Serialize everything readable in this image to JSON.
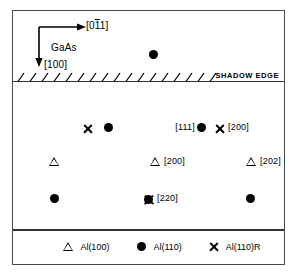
{
  "figure": {
    "orientation": {
      "material_label": "GaAs",
      "horizontal_axis_label_pre": "[0",
      "horizontal_axis_label_bar": "1",
      "horizontal_axis_label_post": "1]",
      "horizontal_axis_label_full": "[011]",
      "vertical_axis_label": "[100]"
    },
    "shadow_edge_label": "SHADOW EDGE",
    "legend": [
      {
        "marker": "triangle-open",
        "label": "Al(100)"
      },
      {
        "marker": "dot-filled",
        "label": "Al(110)"
      },
      {
        "marker": "cross",
        "label": "Al(110)R"
      }
    ],
    "markers": [
      {
        "id": "m0",
        "marker": "dot-filled",
        "x": 136,
        "y": 38,
        "label": ""
      },
      {
        "id": "m1",
        "marker": "cross",
        "x": 69,
        "y": 111,
        "label": ""
      },
      {
        "id": "m2",
        "marker": "dot-filled",
        "x": 91,
        "y": 111,
        "label": ""
      },
      {
        "id": "m3",
        "marker": "dot-filled",
        "x": 184,
        "y": 111,
        "label": "[111]",
        "label_side": "left"
      },
      {
        "id": "m4",
        "marker": "cross",
        "x": 201,
        "y": 111,
        "label": "[200]",
        "label_side": "right"
      },
      {
        "id": "m5",
        "marker": "triangle-open",
        "x": 36,
        "y": 145,
        "label": ""
      },
      {
        "id": "m6",
        "marker": "triangle-open",
        "x": 137,
        "y": 145,
        "label": "[200]",
        "label_side": "right"
      },
      {
        "id": "m7",
        "marker": "triangle-open",
        "x": 233,
        "y": 145,
        "label": "[202]",
        "label_side": "right"
      },
      {
        "id": "m8",
        "marker": "dot-filled",
        "x": 37,
        "y": 182,
        "label": ""
      },
      {
        "id": "m9",
        "marker": "dot-cross",
        "x": 130,
        "y": 182,
        "label": "[220]",
        "label_side": "right"
      },
      {
        "id": "m10",
        "marker": "dot-filled",
        "x": 233,
        "y": 182,
        "label": ""
      }
    ]
  }
}
